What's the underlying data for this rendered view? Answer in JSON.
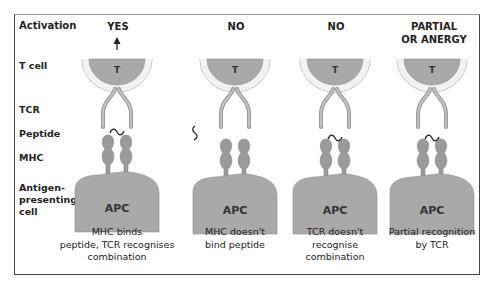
{
  "row_labels": {
    "activation": "Activation",
    "t_cell": "T cell",
    "tcr": "TCR",
    "peptide": "Peptide",
    "mhc": "MHC",
    "apc_line1": "Antigen-",
    "apc_line2": "presenting",
    "apc_line3": "cell"
  },
  "columns": [
    {
      "title_line1": "YES",
      "title_line2": "",
      "t_label": "T",
      "apc_label": "APC",
      "caption_line1": "MHC binds",
      "caption_line2": "peptide, TCR recognises",
      "caption_line3": "combination",
      "arrow": true,
      "peptide_state": "bound"
    },
    {
      "title_line1": "NO",
      "title_line2": "",
      "t_label": "T",
      "apc_label": "APC",
      "caption_line1": "MHC doesn't",
      "caption_line2": "bind peptide",
      "caption_line3": "",
      "arrow": false,
      "peptide_state": "unbound"
    },
    {
      "title_line1": "NO",
      "title_line2": "",
      "t_label": "T",
      "apc_label": "APC",
      "caption_line1": "TCR doesn't",
      "caption_line2": "recognise",
      "caption_line3": "combination",
      "arrow": false,
      "peptide_state": "bound"
    },
    {
      "title_line1": "PARTIAL",
      "title_line2": "OR ANERGY",
      "t_label": "T",
      "apc_label": "APC",
      "caption_line1": "Partial recognition",
      "caption_line2": "by TCR",
      "caption_line3": "",
      "arrow": false,
      "peptide_state": "bound"
    }
  ],
  "colors": {
    "cell_fill": "#a9a9a9",
    "membrane": "#d6d6d6",
    "outline": "#8a8a8a",
    "text": "#222222",
    "frame": "#444444"
  }
}
